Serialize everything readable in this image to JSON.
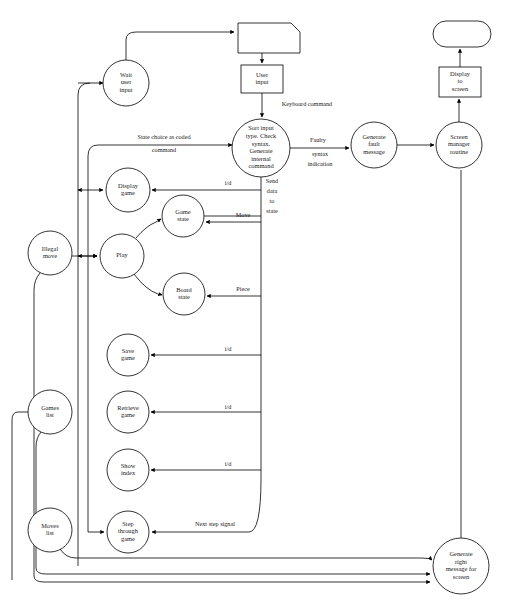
{
  "diagram": {
    "background_color": "#ffffff",
    "line_color": "#000000",
    "nodes": [
      {
        "id": "external-source",
        "label": "",
        "shape": "note",
        "cx": 269,
        "cy": 38,
        "w": 62,
        "h": 30
      },
      {
        "id": "user-input",
        "label": "User\ninput",
        "shape": "rect",
        "cx": 262,
        "cy": 79,
        "w": 42,
        "h": 28
      },
      {
        "id": "wait-user-input",
        "label": "Wait\nuser\ninput",
        "shape": "circle",
        "cx": 126,
        "cy": 83,
        "r": 23
      },
      {
        "id": "sort-input",
        "label": "Sort input\ntype. Check\nsyntax.\nGenerate\ninternal\ncommand",
        "shape": "circle",
        "cx": 261,
        "cy": 148,
        "r": 29
      },
      {
        "id": "generate-fault",
        "label": "Generate\nfault\nmessage",
        "shape": "circle",
        "cx": 374,
        "cy": 145,
        "r": 23
      },
      {
        "id": "screen-manager",
        "label": "Screen\nmanager\nroutine",
        "shape": "circle",
        "cx": 459,
        "cy": 145,
        "r": 23
      },
      {
        "id": "display-to-screen",
        "label": "Display\nto\nscreen",
        "shape": "rect",
        "cx": 460,
        "cy": 82,
        "w": 42,
        "h": 30
      },
      {
        "id": "screen-sink",
        "label": "",
        "shape": "stadium",
        "cx": 462,
        "cy": 34,
        "w": 58,
        "h": 26
      },
      {
        "id": "display-game",
        "label": "Display\ngame",
        "shape": "circle",
        "cx": 128,
        "cy": 190,
        "r": 22
      },
      {
        "id": "game-state",
        "label": "Game\nstate",
        "shape": "circle",
        "cx": 183,
        "cy": 216,
        "r": 21
      },
      {
        "id": "play",
        "label": "Play",
        "shape": "circle",
        "cx": 122,
        "cy": 256,
        "r": 22
      },
      {
        "id": "board-state",
        "label": "Board\nstate",
        "shape": "circle",
        "cx": 184,
        "cy": 294,
        "r": 21
      },
      {
        "id": "illegal-move",
        "label": "Illegal\nmove",
        "shape": "circle",
        "cx": 50,
        "cy": 253,
        "r": 22
      },
      {
        "id": "save-game",
        "label": "Save\ngame",
        "shape": "circle",
        "cx": 128,
        "cy": 355,
        "r": 21
      },
      {
        "id": "retrieve-game",
        "label": "Retrieve\ngame",
        "shape": "circle",
        "cx": 128,
        "cy": 412,
        "r": 21
      },
      {
        "id": "show-index",
        "label": "Show\nindex",
        "shape": "circle",
        "cx": 128,
        "cy": 470,
        "r": 21
      },
      {
        "id": "step-through-game",
        "label": "Step\nthrough\ngame",
        "shape": "circle",
        "cx": 128,
        "cy": 532,
        "r": 21
      },
      {
        "id": "games-list",
        "label": "Games\nlist",
        "shape": "circle",
        "cx": 50,
        "cy": 412,
        "r": 22
      },
      {
        "id": "moves-list",
        "label": "Moves\nlist",
        "shape": "circle",
        "cx": 50,
        "cy": 530,
        "r": 22
      },
      {
        "id": "generate-right-msg",
        "label": "Generate\nright\nmessage for\nscreen",
        "shape": "circle",
        "cx": 461,
        "cy": 566,
        "r": 28
      }
    ],
    "edge_labels": [
      {
        "id": "keyboard-command",
        "text": "Keyboard command",
        "x": 307,
        "y": 105
      },
      {
        "id": "state-choice-1",
        "text": "State choice as coded",
        "x": 164,
        "y": 138
      },
      {
        "id": "state-choice-2",
        "text": "command",
        "x": 164,
        "y": 151
      },
      {
        "id": "faulty-1",
        "text": "Faulty",
        "x": 318,
        "y": 141
      },
      {
        "id": "faulty-2",
        "text": "syntax",
        "x": 320,
        "y": 155
      },
      {
        "id": "faulty-3",
        "text": "indication",
        "x": 320,
        "y": 165
      },
      {
        "id": "send-data-1",
        "text": "Send",
        "x": 272,
        "y": 182
      },
      {
        "id": "send-data-2",
        "text": "data",
        "x": 272,
        "y": 192
      },
      {
        "id": "send-data-3",
        "text": "to",
        "x": 272,
        "y": 202
      },
      {
        "id": "send-data-4",
        "text": "state",
        "x": 272,
        "y": 212
      },
      {
        "id": "id-display-game",
        "text": "i/d",
        "x": 228,
        "y": 184
      },
      {
        "id": "move",
        "text": "Move",
        "x": 243,
        "y": 216
      },
      {
        "id": "piece",
        "text": "Piece",
        "x": 243,
        "y": 290
      },
      {
        "id": "id-save-game",
        "text": "i/d",
        "x": 228,
        "y": 350
      },
      {
        "id": "id-retrieve-game",
        "text": "i/d",
        "x": 228,
        "y": 408
      },
      {
        "id": "id-show-index",
        "text": "i/d",
        "x": 228,
        "y": 465
      },
      {
        "id": "next-step-signal",
        "text": "Next step signal",
        "x": 215,
        "y": 525
      }
    ]
  }
}
